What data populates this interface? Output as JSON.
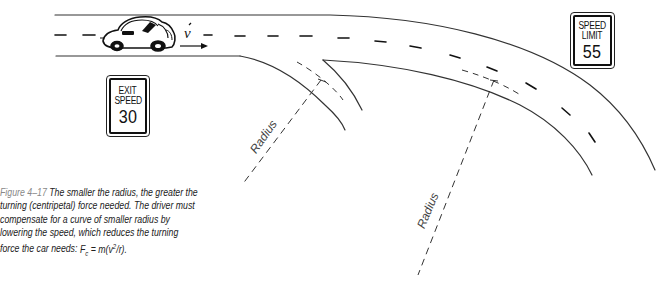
{
  "figure": {
    "label": "Figure 4–17",
    "caption_text": "The smaller the radius, the greater the turning (centripetal) force needed. The driver must compensate for a curve of smaller radius by lowering the speed, which reduces the turning force the car needs:",
    "formula": "F",
    "formula_sub": "c",
    "formula_eq": " = m(v",
    "formula_sup": "2",
    "formula_end": "/r)."
  },
  "signs": {
    "exit": {
      "line1": "EXIT",
      "line2": "SPEED",
      "number": "30"
    },
    "limit": {
      "line1": "SPEED",
      "line2": "LIMIT",
      "number": "55"
    }
  },
  "labels": {
    "velocity": "v",
    "radius_small": "Radius",
    "radius_large": "Radius"
  },
  "colors": {
    "ink": "#222222",
    "caption_label": "#888888",
    "background": "#ffffff"
  }
}
